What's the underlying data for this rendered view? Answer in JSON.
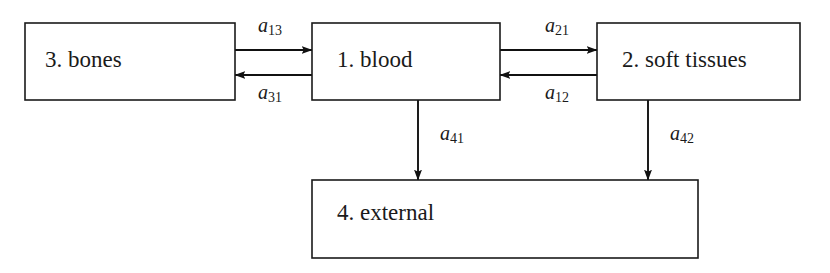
{
  "diagram": {
    "background_color": "#ffffff",
    "line_color": "#111111",
    "text_color": "#1a1a1a",
    "boxes": [
      {
        "id": "bones",
        "label": "3. bones",
        "number": "3",
        "name": "bones",
        "x": 25,
        "y": 23,
        "width": 210,
        "height": 77,
        "text_x": 45,
        "text_y": 62
      },
      {
        "id": "blood",
        "label": "1. blood",
        "number": "1",
        "name": "blood",
        "x": 312,
        "y": 23,
        "width": 188,
        "height": 77,
        "text_x": 337,
        "text_y": 62
      },
      {
        "id": "soft_tissues",
        "label": "2. soft tissues",
        "number": "2",
        "name": "soft tissues",
        "x": 597,
        "y": 23,
        "width": 203,
        "height": 77,
        "text_x": 622,
        "text_y": 62
      },
      {
        "id": "external",
        "label": "4. external",
        "number": "4",
        "name": "external",
        "x": 312,
        "y": 180,
        "width": 386,
        "height": 78,
        "text_x": 337,
        "text_y": 215
      }
    ],
    "arrows": [
      {
        "id": "a13",
        "label_base": "a",
        "label_sub": "13",
        "from": "bones",
        "to": "blood",
        "direction": "right",
        "label_x": 258,
        "label_y": 27,
        "x1": 235,
        "y1": 50,
        "x2": 312,
        "y2": 50
      },
      {
        "id": "a31",
        "label_base": "a",
        "label_sub": "31",
        "from": "blood",
        "to": "bones",
        "direction": "left",
        "label_x": 258,
        "label_y": 94,
        "x1": 312,
        "y1": 75,
        "x2": 235,
        "y2": 75
      },
      {
        "id": "a21",
        "label_base": "a",
        "label_sub": "21",
        "from": "blood",
        "to": "soft_tissues",
        "direction": "right",
        "label_x": 545,
        "label_y": 27,
        "x1": 500,
        "y1": 50,
        "x2": 597,
        "y2": 50
      },
      {
        "id": "a12",
        "label_base": "a",
        "label_sub": "12",
        "from": "soft_tissues",
        "to": "blood",
        "direction": "left",
        "label_x": 545,
        "label_y": 94,
        "x1": 597,
        "y1": 75,
        "x2": 500,
        "y2": 75
      },
      {
        "id": "a41",
        "label_base": "a",
        "label_sub": "41",
        "from": "blood",
        "to": "external",
        "direction": "down",
        "label_x": 440,
        "label_y": 135,
        "x1": 418,
        "y1": 100,
        "x2": 418,
        "y2": 180
      },
      {
        "id": "a42",
        "label_base": "a",
        "label_sub": "42",
        "from": "soft_tissues",
        "to": "external",
        "direction": "down",
        "label_x": 670,
        "label_y": 135,
        "x1": 648,
        "y1": 100,
        "x2": 648,
        "y2": 180
      }
    ]
  }
}
